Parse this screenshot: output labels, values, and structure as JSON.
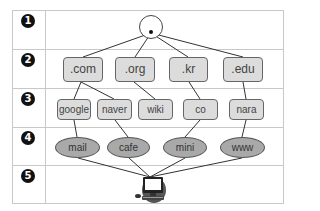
{
  "levels": [
    {
      "number": "1"
    },
    {
      "number": "2"
    },
    {
      "number": "3"
    },
    {
      "number": "4"
    },
    {
      "number": "5"
    }
  ],
  "root": {
    "label": ".",
    "icon": "root-circle"
  },
  "top_level_domains": [
    ".com",
    ".org",
    ".kr",
    ".edu"
  ],
  "second_level_domains": [
    "google",
    "naver",
    "wiki",
    "co",
    "nara"
  ],
  "hosts": [
    "mail",
    "cafe",
    "mini",
    "www"
  ],
  "client": {
    "icon": "computer-icon"
  },
  "edges": [
    [
      ".",
      ".com"
    ],
    [
      ".",
      ".org"
    ],
    [
      ".",
      ".kr"
    ],
    [
      ".",
      ".edu"
    ],
    [
      ".com",
      "google"
    ],
    [
      ".com",
      "naver"
    ],
    [
      ".org",
      "wiki"
    ],
    [
      ".kr",
      "co"
    ],
    [
      ".edu",
      "nara"
    ],
    [
      "google",
      "mail"
    ],
    [
      "naver",
      "cafe"
    ],
    [
      "co",
      "mini"
    ],
    [
      "nara",
      "www"
    ],
    [
      "mail",
      "computer"
    ],
    [
      "cafe",
      "computer"
    ],
    [
      "mini",
      "computer"
    ],
    [
      "www",
      "computer"
    ]
  ],
  "colors": {
    "box_fill": "#dcdcdc",
    "ellipse_fill": "#a9a9a9",
    "line": "#333333",
    "grid": "#c8c8c8"
  }
}
